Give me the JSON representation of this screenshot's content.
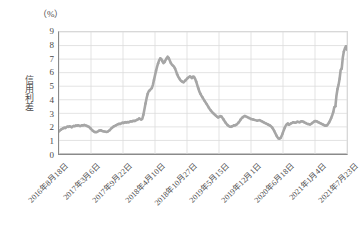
{
  "chart_data": {
    "type": "line",
    "title": "",
    "subtitle": "",
    "unit_label": "（%）",
    "ylabel": "信用利差",
    "xlabel": "",
    "ylim": [
      0,
      9
    ],
    "y_ticks": [
      "9",
      "8",
      "7",
      "6",
      "5",
      "4",
      "3",
      "2",
      "1",
      "0"
    ],
    "grid": true,
    "legend": "none",
    "series_color": "#a6a6a6",
    "x_tick_labels": [
      "2016年8月18日",
      "2017年3月6日",
      "2017年9月22日",
      "2018年4月10日",
      "2018年10月27日",
      "2019年5月15日",
      "2019年12月1日",
      "2020年6月18日",
      "2021年1月4日",
      "2021年7月23日"
    ],
    "x_range": [
      "2016年8月18日",
      "2021年7月23日"
    ],
    "annotations": [],
    "series": [
      {
        "name": "信用利差",
        "values": [
          1.68,
          1.75,
          1.8,
          1.86,
          1.9,
          1.95,
          1.92,
          1.97,
          2.02,
          2.0,
          2.05,
          2.02,
          1.98,
          2.04,
          2.07,
          2.05,
          2.1,
          2.08,
          2.12,
          2.1,
          2.06,
          2.09,
          2.12,
          2.1,
          2.14,
          2.11,
          2.08,
          2.05,
          2.02,
          1.96,
          1.88,
          1.8,
          1.72,
          1.66,
          1.62,
          1.6,
          1.63,
          1.67,
          1.72,
          1.75,
          1.73,
          1.7,
          1.68,
          1.66,
          1.64,
          1.63,
          1.65,
          1.7,
          1.76,
          1.84,
          1.92,
          1.98,
          2.04,
          2.08,
          2.12,
          2.16,
          2.2,
          2.24,
          2.22,
          2.26,
          2.3,
          2.28,
          2.32,
          2.35,
          2.33,
          2.36,
          2.34,
          2.38,
          2.41,
          2.39,
          2.43,
          2.46,
          2.44,
          2.48,
          2.52,
          2.56,
          2.62,
          2.58,
          2.54,
          2.6,
          2.9,
          3.3,
          3.72,
          4.1,
          4.42,
          4.62,
          4.7,
          4.78,
          4.86,
          5.1,
          5.45,
          5.8,
          6.15,
          6.45,
          6.7,
          6.92,
          7.05,
          7.0,
          6.85,
          6.7,
          6.78,
          6.92,
          7.05,
          7.18,
          7.08,
          6.9,
          6.72,
          6.6,
          6.52,
          6.44,
          6.3,
          6.1,
          5.88,
          5.7,
          5.58,
          5.45,
          5.38,
          5.32,
          5.3,
          5.36,
          5.44,
          5.52,
          5.6,
          5.66,
          5.72,
          5.68,
          5.6,
          5.72,
          5.68,
          5.55,
          5.35,
          5.1,
          4.85,
          4.62,
          4.45,
          4.3,
          4.18,
          4.05,
          3.92,
          3.8,
          3.68,
          3.55,
          3.42,
          3.3,
          3.2,
          3.1,
          3.02,
          2.95,
          2.88,
          2.8,
          2.74,
          2.68,
          2.75,
          2.8,
          2.76,
          2.66,
          2.54,
          2.42,
          2.3,
          2.2,
          2.12,
          2.06,
          2.02,
          2.0,
          2.04,
          2.08,
          2.12,
          2.1,
          2.16,
          2.22,
          2.3,
          2.4,
          2.52,
          2.62,
          2.7,
          2.76,
          2.8,
          2.78,
          2.74,
          2.7,
          2.66,
          2.62,
          2.58,
          2.56,
          2.54,
          2.52,
          2.5,
          2.48,
          2.46,
          2.48,
          2.5,
          2.46,
          2.42,
          2.38,
          2.34,
          2.3,
          2.26,
          2.22,
          2.18,
          2.14,
          2.1,
          2.04,
          1.96,
          1.84,
          1.7,
          1.54,
          1.38,
          1.24,
          1.16,
          1.12,
          1.18,
          1.32,
          1.52,
          1.74,
          1.94,
          2.1,
          2.2,
          2.26,
          2.16,
          2.2,
          2.26,
          2.3,
          2.34,
          2.32,
          2.3,
          2.34,
          2.38,
          2.36,
          2.34,
          2.38,
          2.42,
          2.4,
          2.36,
          2.32,
          2.28,
          2.24,
          2.22,
          2.2,
          2.18,
          2.22,
          2.28,
          2.34,
          2.4,
          2.44,
          2.42,
          2.38,
          2.34,
          2.3,
          2.26,
          2.22,
          2.18,
          2.14,
          2.1,
          2.08,
          2.12,
          2.2,
          2.32,
          2.48,
          2.66,
          2.86,
          3.1,
          3.46,
          3.52,
          4.3,
          4.8,
          5.1,
          5.55,
          6.2,
          6.3,
          7.1,
          7.55,
          7.8,
          7.95,
          7.7
        ]
      }
    ]
  }
}
